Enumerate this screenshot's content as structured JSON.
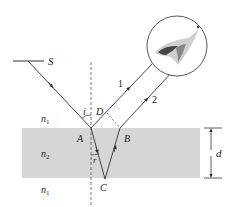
{
  "diagram": {
    "labels": {
      "source": "S",
      "point_a": "A",
      "point_b": "B",
      "point_c": "C",
      "point_d": "D",
      "incidence_angle": "i",
      "refraction_angle": "r",
      "ray_1": "1",
      "ray_2": "2",
      "medium_top": "n",
      "medium_top_sub": "1",
      "medium_film": "n",
      "medium_film_sub": "2",
      "medium_bottom": "n",
      "medium_bottom_sub": "1",
      "thickness": "d"
    },
    "colors": {
      "film": "#d6d6d6",
      "line": "#333333",
      "background": "#ffffff"
    }
  }
}
